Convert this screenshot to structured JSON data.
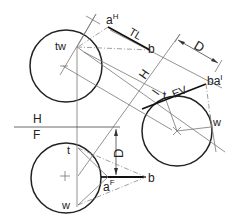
{
  "labels": {
    "top_tw": "tw",
    "top_a": "a",
    "top_a_sup": "H",
    "top_b": "b",
    "TL": "TL",
    "dim_D_top": "D",
    "H_ref": "H",
    "one_ref": "I",
    "EV": "EV",
    "ba": "ba",
    "ba_sup": "I",
    "aux_t": "t",
    "aux_w": "w",
    "H_fold": "H",
    "F_fold": "F",
    "dim_D_front": "D",
    "front_t": "t",
    "front_w": "w",
    "front_a": "a",
    "front_a_sup": "F",
    "front_b": "b"
  },
  "circles": [
    {
      "name": "top-view-circle",
      "cx": 67,
      "cy": 66,
      "r": 36
    },
    {
      "name": "aux-view-circle",
      "cx": 177,
      "cy": 130,
      "r": 35
    },
    {
      "name": "front-view-circle",
      "cx": 67,
      "cy": 178,
      "r": 35
    }
  ]
}
